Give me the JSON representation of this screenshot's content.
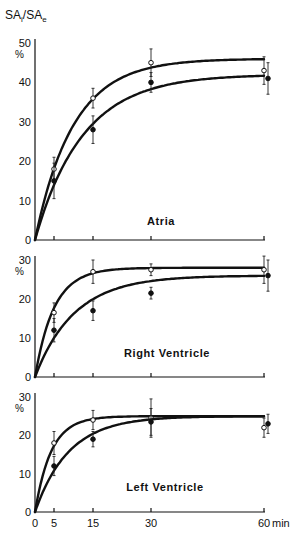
{
  "chart_data": {
    "type": "line",
    "ylabel_main": "SA",
    "ylabel_sub1": "i",
    "ylabel_slash": "/SA",
    "ylabel_sub2": "e",
    "x": [
      5,
      15,
      30,
      60
    ],
    "xticks": [
      "0",
      "5",
      "15",
      "30",
      "60"
    ],
    "xtick_values": [
      0,
      5,
      15,
      30,
      60
    ],
    "xunit": "min",
    "xlim": [
      0,
      60
    ],
    "markers": {
      "open": "open circle",
      "filled": "filled circle"
    },
    "panels": [
      {
        "name": "Atria",
        "label": "Atria",
        "yunit": "%",
        "ylim": [
          0,
          50
        ],
        "yticks": [
          "0",
          "10",
          "20",
          "30",
          "40",
          "50"
        ],
        "ytick_values": [
          0,
          10,
          20,
          30,
          40,
          50
        ],
        "series": [
          {
            "name": "open",
            "values": [
              18,
              36,
              45,
              43
            ],
            "errors": [
              3,
              2.5,
              3.5,
              3.5
            ],
            "plateau": 46
          },
          {
            "name": "filled",
            "values": [
              15,
              28,
              40,
              41
            ],
            "errors": [
              4.5,
              3.5,
              2.5,
              4
            ],
            "plateau": 42
          }
        ]
      },
      {
        "name": "Right Ventricle",
        "label": "Right Ventricle",
        "yunit": "%",
        "ylim": [
          0,
          30
        ],
        "yticks": [
          "0",
          "10",
          "20",
          "30"
        ],
        "ytick_values": [
          0,
          10,
          20,
          30
        ],
        "series": [
          {
            "name": "open",
            "values": [
              16.5,
              27,
              27.5,
              27.5
            ],
            "errors": [
              2.5,
              3,
              1.5,
              3.5
            ],
            "plateau": 28
          },
          {
            "name": "filled",
            "values": [
              12,
              17,
              21.5,
              26
            ],
            "errors": [
              3,
              2.5,
              1.5,
              4
            ],
            "plateau": 26
          }
        ]
      },
      {
        "name": "Left Ventricle",
        "label": "Left Ventricle",
        "yunit": "%",
        "ylim": [
          0,
          30
        ],
        "yticks": [
          "0",
          "10",
          "20",
          "30"
        ],
        "ytick_values": [
          0,
          10,
          20,
          30
        ],
        "series": [
          {
            "name": "open",
            "values": [
              18,
              24,
              24.5,
              22
            ],
            "errors": [
              3,
              2.5,
              5,
              2.5
            ],
            "plateau": 25
          },
          {
            "name": "filled",
            "values": [
              12,
              19,
              23.5,
              23
            ],
            "errors": [
              2.5,
              2,
              3.5,
              2.5
            ],
            "plateau": 25
          }
        ]
      }
    ]
  }
}
